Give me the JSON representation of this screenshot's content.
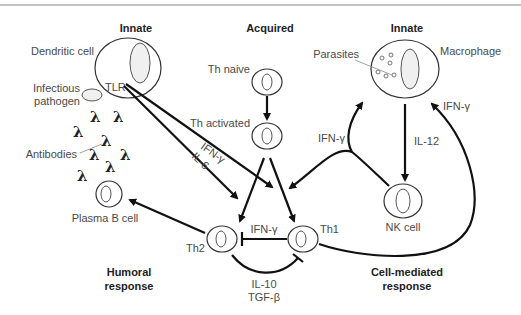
{
  "headers": {
    "innate_left": "Innate",
    "acquired": "Acquired",
    "innate_right": "Innate",
    "humoral_line1": "Humoral",
    "humoral_line2": "response",
    "cellmed_line1": "Cell-mediated",
    "cellmed_line2": "response"
  },
  "cells": {
    "dendritic": "Dendritic cell",
    "tlr": "TLR",
    "pathogen_line1": "Infectious",
    "pathogen_line2": "pathogen",
    "antibodies": "Antibodies",
    "plasma_b": "Plasma B cell",
    "th_naive": "Th naive",
    "th_activated": "Th activated",
    "th2": "Th2",
    "th1": "Th1",
    "parasites": "Parasites",
    "macrophage": "Macrophage",
    "nk": "NK cell"
  },
  "signals": {
    "ifn_gamma_tlr": "IFN-γ",
    "il6": "IL-6",
    "ifn_gamma_nk": "IFN-γ",
    "il12": "IL-12",
    "ifn_gamma_mac": "IFN-γ",
    "ifn_gamma_th1_th2": "IFN-γ",
    "il10": "IL-10",
    "tgf_beta": "TGF-β"
  },
  "antibody_glyph": "λ"
}
